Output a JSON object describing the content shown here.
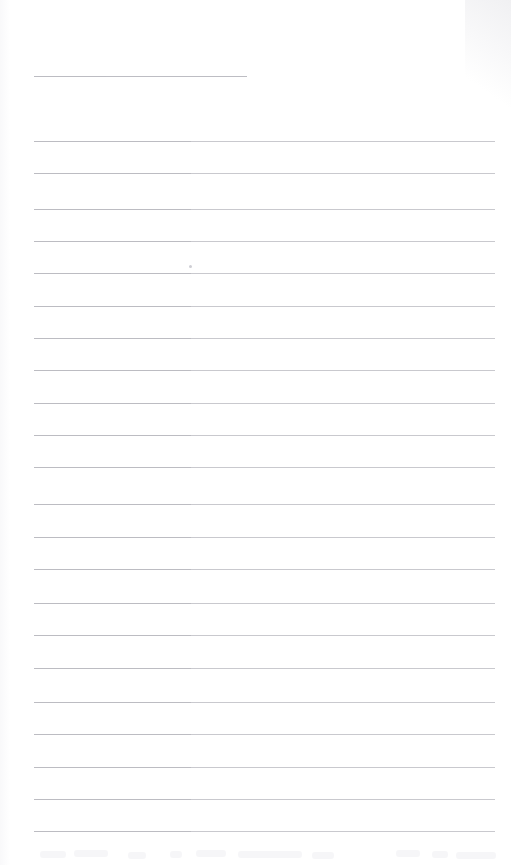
{
  "document": {
    "kind": "scanned-lined-paper",
    "title": "Blank ruled page",
    "page_width": 511,
    "page_height": 865,
    "background_color": "#ffffff",
    "rule_color": "#c9c9ce",
    "rule_thickness_px": 1,
    "rule_left_margin_px": 34,
    "rule_right_edge_px": 495,
    "rule_spacing_px": 32.4,
    "total_rules": 23,
    "body_text": "",
    "handwriting_present": "none"
  },
  "rules": [
    {
      "index": 1,
      "y": 76,
      "x": 34,
      "width": 213,
      "variant": "short"
    },
    {
      "index": 2,
      "y": 141,
      "x": 34,
      "width": 461,
      "variant": "full"
    },
    {
      "index": 3,
      "y": 173,
      "x": 34,
      "width": 461,
      "variant": "full"
    },
    {
      "index": 4,
      "y": 209,
      "x": 34,
      "width": 461,
      "variant": "full"
    },
    {
      "index": 5,
      "y": 241,
      "x": 34,
      "width": 461,
      "variant": "full"
    },
    {
      "index": 6,
      "y": 273,
      "x": 34,
      "width": 461,
      "variant": "full"
    },
    {
      "index": 7,
      "y": 306,
      "x": 34,
      "width": 461,
      "variant": "full"
    },
    {
      "index": 8,
      "y": 338,
      "x": 34,
      "width": 461,
      "variant": "full"
    },
    {
      "index": 9,
      "y": 370,
      "x": 34,
      "width": 461,
      "variant": "full"
    },
    {
      "index": 10,
      "y": 403,
      "x": 34,
      "width": 461,
      "variant": "full"
    },
    {
      "index": 11,
      "y": 435,
      "x": 34,
      "width": 461,
      "variant": "full"
    },
    {
      "index": 12,
      "y": 467,
      "x": 34,
      "width": 461,
      "variant": "full"
    },
    {
      "index": 13,
      "y": 504,
      "x": 34,
      "width": 461,
      "variant": "full"
    },
    {
      "index": 14,
      "y": 537,
      "x": 34,
      "width": 461,
      "variant": "full"
    },
    {
      "index": 15,
      "y": 569,
      "x": 34,
      "width": 461,
      "variant": "full"
    },
    {
      "index": 16,
      "y": 603,
      "x": 34,
      "width": 461,
      "variant": "full"
    },
    {
      "index": 17,
      "y": 635,
      "x": 34,
      "width": 461,
      "variant": "full"
    },
    {
      "index": 18,
      "y": 668,
      "x": 34,
      "width": 461,
      "variant": "full"
    },
    {
      "index": 19,
      "y": 702,
      "x": 34,
      "width": 461,
      "variant": "full"
    },
    {
      "index": 20,
      "y": 734,
      "x": 34,
      "width": 461,
      "variant": "full"
    },
    {
      "index": 21,
      "y": 767,
      "x": 34,
      "width": 461,
      "variant": "full"
    },
    {
      "index": 22,
      "y": 799,
      "x": 34,
      "width": 461,
      "variant": "full"
    },
    {
      "index": 23,
      "y": 831,
      "x": 34,
      "width": 461,
      "variant": "full"
    }
  ],
  "artifacts": {
    "specks": [
      {
        "name": "ink-speck",
        "x": 189,
        "y": 265
      }
    ],
    "bleed_marks": [
      {
        "x": 40,
        "y": 851,
        "width": 26
      },
      {
        "x": 74,
        "y": 850,
        "width": 34
      },
      {
        "x": 128,
        "y": 852,
        "width": 18
      },
      {
        "x": 170,
        "y": 851,
        "width": 12
      },
      {
        "x": 196,
        "y": 850,
        "width": 30
      },
      {
        "x": 238,
        "y": 851,
        "width": 64
      },
      {
        "x": 312,
        "y": 852,
        "width": 22
      },
      {
        "x": 396,
        "y": 850,
        "width": 24
      },
      {
        "x": 432,
        "y": 851,
        "width": 16
      },
      {
        "x": 456,
        "y": 852,
        "width": 40
      }
    ]
  }
}
